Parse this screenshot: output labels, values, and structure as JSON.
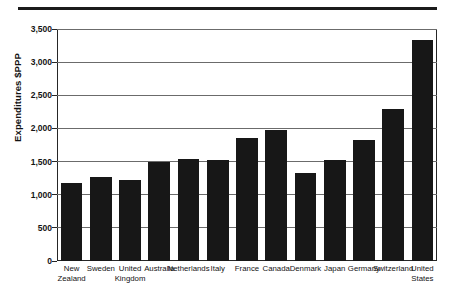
{
  "chart_data": {
    "type": "bar",
    "title": "",
    "subtitle": "",
    "xlabel": "",
    "ylabel": "Expenditures $PPP",
    "ylim": [
      0,
      3500
    ],
    "ytick_values": [
      0,
      500,
      1000,
      1500,
      2000,
      2500,
      3000,
      3500
    ],
    "ytick_labels": [
      "0",
      "500",
      "1,000",
      "1,500",
      "2,000",
      "2,500",
      "3,000",
      "3,500"
    ],
    "grid": true,
    "legend": "none",
    "orientation": "vertical",
    "bar_color": "#171717",
    "categories": [
      "New Zealand",
      "Sweden",
      "United Kingdom",
      "Australia",
      "Netherlands",
      "Italy",
      "France",
      "Canada",
      "Denmark",
      "Japan",
      "Germany",
      "Switzerland",
      "United States"
    ],
    "category_lines": [
      [
        "New",
        "Zealand"
      ],
      [
        "Sweden",
        ""
      ],
      [
        "United",
        "Kingdom"
      ],
      [
        "Australia",
        ""
      ],
      [
        "Netherlands",
        ""
      ],
      [
        "Italy",
        ""
      ],
      [
        "France",
        ""
      ],
      [
        "Canada",
        ""
      ],
      [
        "Denmark",
        ""
      ],
      [
        "Japan",
        ""
      ],
      [
        "Germany",
        ""
      ],
      [
        "Switzerland",
        ""
      ],
      [
        "United",
        "States"
      ]
    ],
    "values": [
      1180,
      1270,
      1220,
      1490,
      1535,
      1530,
      1855,
      1980,
      1330,
      1520,
      1820,
      2300,
      3340
    ]
  },
  "decorations": {
    "top_rule": "horizontal-rule"
  }
}
